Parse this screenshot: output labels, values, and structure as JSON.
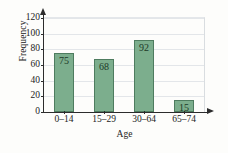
{
  "chart_data": {
    "type": "bar",
    "title": "",
    "categories": [
      "0–14",
      "15–29",
      "30–64",
      "65–74"
    ],
    "values": [
      75,
      68,
      92,
      15
    ],
    "value_labels": [
      "75",
      "68",
      "92",
      "15"
    ],
    "xlabel": "Age",
    "ylabel": "Frequency",
    "ylim": [
      0,
      120
    ],
    "yticks": [
      0,
      20,
      40,
      60,
      80,
      100,
      120
    ],
    "ytick_labels": [
      "0",
      "20",
      "40",
      "60",
      "80",
      "100",
      "120"
    ],
    "grid": "horizontal",
    "legend": "none",
    "colors": {
      "bar_fill": "#7cae8d",
      "bar_border": "#4e7c5f",
      "axis": "#2c2c2c",
      "gridline": "#e3e6e9",
      "text": "#232323",
      "value_label": "#1d3a28",
      "background": "#fdfdfb"
    }
  }
}
